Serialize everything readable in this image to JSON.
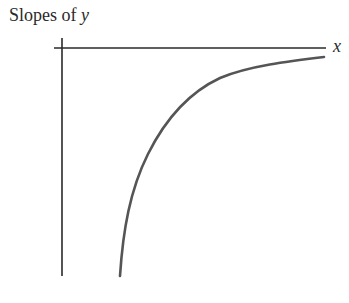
{
  "title": {
    "prefix": "Slopes of ",
    "variable": "y"
  },
  "axes": {
    "x_label": "x",
    "y_label": ""
  },
  "colors": {
    "ink": "#2a2a2a",
    "curve": "#555555",
    "background": "#ffffff"
  },
  "curve": {
    "description": "Slope of y: large negative values near vertical axis region, increasing and approaching 0 asymptotically as x grows",
    "points_px": [
      [
        120,
        276
      ],
      [
        124,
        250
      ],
      [
        134,
        200
      ],
      [
        150,
        150
      ],
      [
        170,
        110
      ],
      [
        190,
        93
      ],
      [
        210,
        82
      ],
      [
        240,
        70
      ],
      [
        270,
        64
      ],
      [
        300,
        61
      ],
      [
        324,
        57
      ]
    ]
  }
}
